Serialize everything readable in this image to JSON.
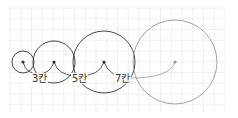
{
  "diagram": {
    "grid": {
      "x0": 10,
      "y0": 8,
      "x1": 225,
      "y1": 112,
      "step": 10.75,
      "color": "#d0d0d0"
    },
    "circles": [
      {
        "cx": 23,
        "cy": 62,
        "r": 11,
        "stroke": "#333333"
      },
      {
        "cx": 54,
        "cy": 62,
        "r": 21,
        "stroke": "#333333"
      },
      {
        "cx": 104,
        "cy": 62,
        "r": 31,
        "stroke": "#333333"
      },
      {
        "cx": 175,
        "cy": 62,
        "r": 42,
        "stroke": "#999999"
      }
    ],
    "labels": [
      {
        "text": "3칸",
        "x": 32,
        "y": 82
      },
      {
        "text": "5칸",
        "x": 72,
        "y": 82
      },
      {
        "text": "7칸",
        "x": 115,
        "y": 82
      }
    ]
  }
}
